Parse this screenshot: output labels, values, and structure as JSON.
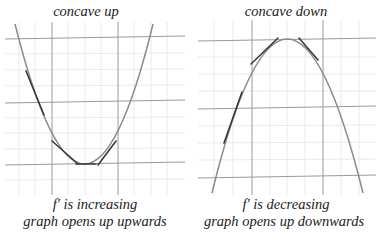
{
  "panels": [
    {
      "id": "concave-up",
      "title": "concave up",
      "caption_line1": "f' is increasing",
      "caption_line2": "graph opens up upwards"
    },
    {
      "id": "concave-down",
      "title": "concave down",
      "caption_line1": "f' is decreasing",
      "caption_line2": "graph opens up downwards"
    }
  ],
  "colors": {
    "curve": "#8a8a8a",
    "tangent": "#3a3a3a",
    "major_grid": "#9a9a9a",
    "minor_grid": "#e4e4e4",
    "text": "#222222"
  }
}
